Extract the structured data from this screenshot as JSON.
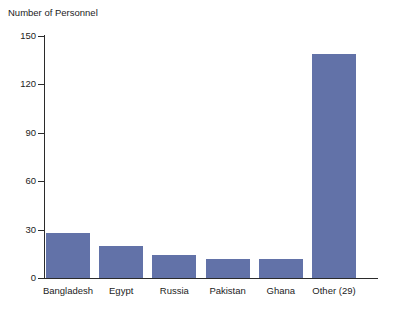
{
  "chart_data": {
    "type": "bar",
    "title": "",
    "ylabel": "Number of Personnel",
    "xlabel": "",
    "categories": [
      "Bangladesh",
      "Egypt",
      "Russia",
      "Pakistan",
      "Ghana",
      "Other (29)"
    ],
    "values": [
      28,
      20,
      14,
      12,
      12,
      139
    ],
    "ylim": [
      0,
      150
    ],
    "yticks": [
      0,
      30,
      60,
      90,
      120,
      150
    ],
    "ytick_labels": [
      "0",
      "30",
      "60",
      "90",
      "120",
      "150"
    ],
    "grid": false,
    "legend": null,
    "bar_color": "#6272a8",
    "axis_color": "#2b2b2b",
    "background_color": "#ffffff"
  }
}
